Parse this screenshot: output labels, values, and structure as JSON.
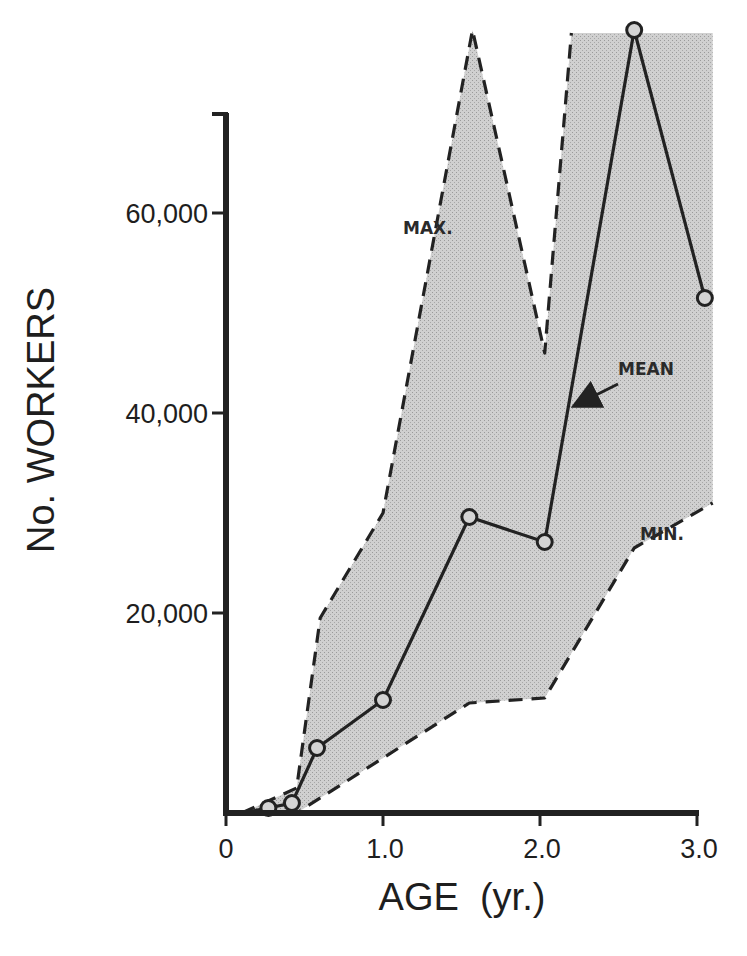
{
  "chart_data": {
    "type": "area",
    "title": "",
    "xlabel": "AGE  (yr.)",
    "ylabel": "No. WORKERS",
    "xlim": [
      0,
      3.0
    ],
    "ylim": [
      0,
      70000
    ],
    "x_ticks": [
      0,
      1.0,
      2.0,
      3.0
    ],
    "x_tick_labels": [
      "0",
      "1.0",
      "2.0",
      "3.0"
    ],
    "y_ticks": [
      20000,
      40000,
      60000
    ],
    "y_tick_labels": [
      "20,000",
      "40,000",
      "60,000"
    ],
    "grid": false,
    "legend": null,
    "annotations": [
      {
        "text": "MAX.",
        "x": 1.12,
        "y": 58500
      },
      {
        "text": "MEAN",
        "x": 2.45,
        "y": 44000,
        "arrow_to": [
          2.18,
          40500
        ]
      },
      {
        "text": "MIN.",
        "x": 2.6,
        "y": 27500
      }
    ],
    "series": [
      {
        "name": "MEAN",
        "style": "solid line with open circle markers",
        "x": [
          0.27,
          0.42,
          0.58,
          1.0,
          1.55,
          2.03,
          2.6,
          3.05
        ],
        "values": [
          500,
          1000,
          6500,
          11300,
          29600,
          27100,
          78300,
          51500
        ]
      },
      {
        "name": "MAX.",
        "style": "dashed line",
        "x": [
          0.1,
          0.45,
          0.6,
          1.0,
          1.57,
          2.03,
          2.2,
          3.1
        ],
        "values": [
          0,
          2500,
          19500,
          30000,
          79000,
          46000,
          78000,
          78000
        ]
      },
      {
        "name": "MIN.",
        "style": "dashed line",
        "x": [
          0.1,
          0.45,
          1.55,
          2.03,
          2.6,
          3.1
        ],
        "values": [
          0,
          0,
          11000,
          11500,
          26500,
          31000
        ]
      }
    ],
    "shaded_region": {
      "between": [
        "MIN.",
        "MAX."
      ],
      "color": "#c8c8c8"
    }
  },
  "labels": {
    "ylabel": "No. WORKERS",
    "xlabel": "AGE  (yr.)",
    "max": "MAX.",
    "mean": "MEAN",
    "min": "MIN."
  },
  "colors": {
    "ink": "#222222",
    "shade": "#c9c9c9",
    "background": "#ffffff"
  }
}
